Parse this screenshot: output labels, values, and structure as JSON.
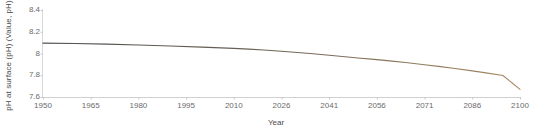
{
  "chart_data": {
    "type": "line",
    "title": "",
    "xlabel": "Year",
    "ylabel": "pH at surface (pH) (Value, pH)",
    "xlim": [
      1950,
      2100
    ],
    "ylim": [
      7.6,
      8.4
    ],
    "grid": false,
    "legend": "none",
    "x_ticks": [
      "1950",
      "1965",
      "1980",
      "1995",
      "2010",
      "2026",
      "2041",
      "2056",
      "2071",
      "2086",
      "2100"
    ],
    "y_ticks": [
      "8.4",
      "8.2",
      "8",
      "7.8",
      "7.6"
    ],
    "line_color_start": "#4f4f4f",
    "line_color_end": "#a98a62",
    "series": [
      {
        "name": "pH at surface",
        "x": [
          1950,
          1960,
          1970,
          1980,
          1990,
          2000,
          2010,
          2015,
          2020,
          2026,
          2030,
          2035,
          2041,
          2046,
          2050,
          2056,
          2060,
          2065,
          2071,
          2076,
          2080,
          2086,
          2090,
          2095,
          2100
        ],
        "values": [
          8.095,
          8.092,
          8.086,
          8.078,
          8.069,
          8.059,
          8.047,
          8.04,
          8.032,
          8.021,
          8.012,
          8.0,
          7.984,
          7.97,
          7.959,
          7.944,
          7.932,
          7.917,
          7.897,
          7.879,
          7.864,
          7.84,
          7.822,
          7.798,
          7.67
        ]
      }
    ]
  },
  "axes": {
    "y_title": "pH at surface (pH) (Value, pH)",
    "x_title": "Year"
  }
}
